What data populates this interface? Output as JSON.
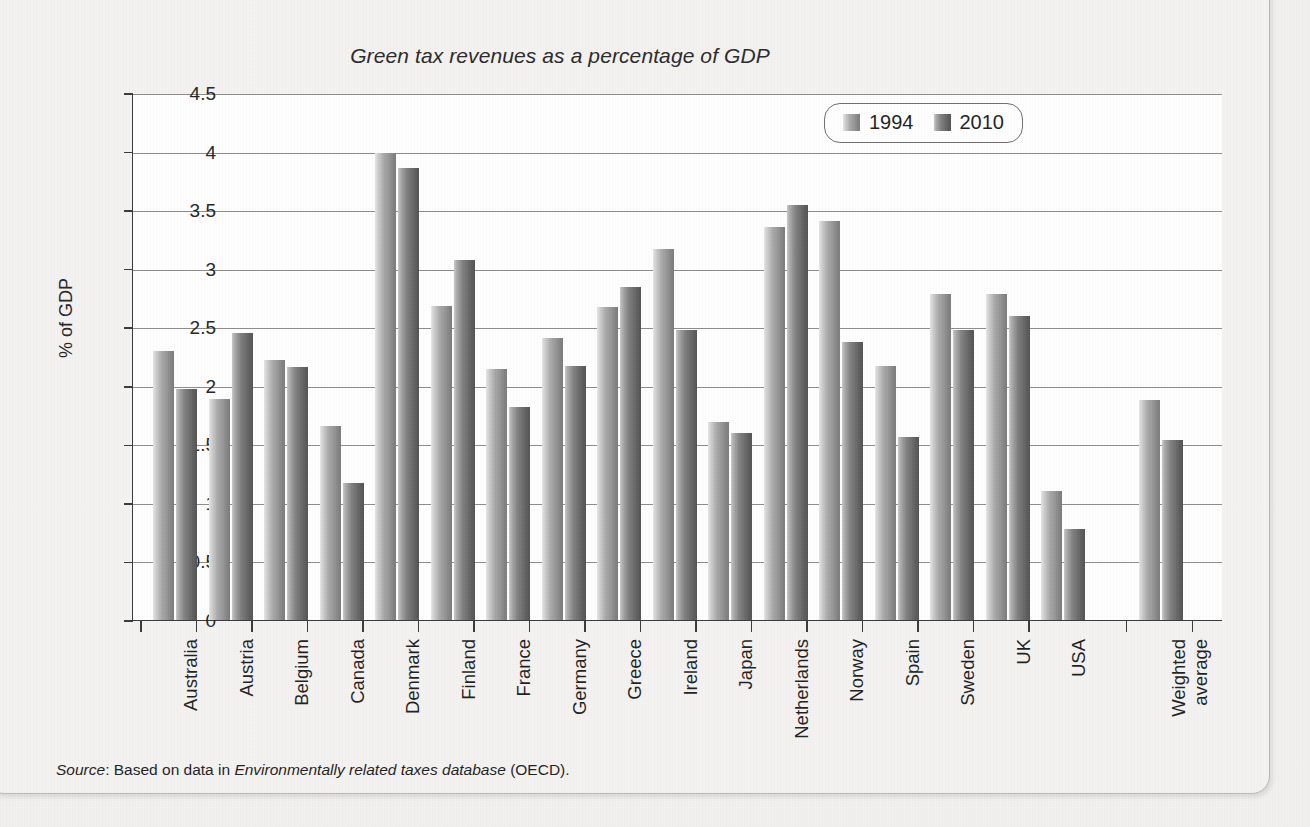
{
  "chart_data": {
    "type": "bar",
    "title": "Green tax revenues as a percentage of GDP",
    "xlabel": "",
    "ylabel": "% of GDP",
    "ylim": [
      0,
      4.5
    ],
    "ytick_step": 0.5,
    "ytick_labels": [
      "4.5",
      "4",
      "3.5",
      "3",
      "2.5",
      "2",
      "1.5",
      "1",
      "0.5",
      "0"
    ],
    "grid": true,
    "legend_position": "top-right",
    "categories": [
      "Australia",
      "Austria",
      "Belgium",
      "Canada",
      "Denmark",
      "Finland",
      "France",
      "Germany",
      "Greece",
      "Ireland",
      "Japan",
      "Netherlands",
      "Norway",
      "Spain",
      "Sweden",
      "UK",
      "USA",
      "Weighted average"
    ],
    "series": [
      {
        "name": "1994",
        "color": "#9a9a9a",
        "values": [
          2.3,
          1.89,
          2.22,
          1.66,
          3.99,
          2.68,
          2.14,
          2.41,
          2.67,
          3.17,
          1.69,
          3.36,
          3.41,
          2.17,
          2.78,
          2.78,
          1.1,
          1.88
        ]
      },
      {
        "name": "2010",
        "color": "#6f6f6f",
        "values": [
          1.97,
          2.45,
          2.16,
          1.17,
          3.86,
          3.07,
          1.82,
          2.17,
          2.84,
          2.48,
          1.6,
          3.54,
          2.37,
          1.56,
          2.48,
          2.6,
          0.78,
          1.54
        ]
      }
    ]
  },
  "legend": {
    "entries": [
      {
        "label": "1994"
      },
      {
        "label": "2010"
      }
    ]
  },
  "source": {
    "prefix": "Source",
    "separator": ": ",
    "lead": "Based on data in ",
    "database": "Environmentally related taxes database",
    "tail": " (OECD)."
  }
}
